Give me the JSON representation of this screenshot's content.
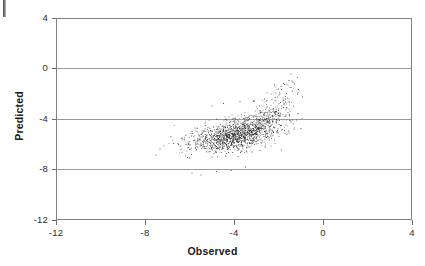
{
  "figure": {
    "name": "observed-vs-predicted-scatter",
    "artifact_label": "scan-edge-mark"
  },
  "axes": {
    "x_title": "Observed",
    "y_title": "Predicted",
    "x_ticks": [
      "-12",
      "-8",
      "-4",
      "0",
      "4"
    ],
    "y_ticks": [
      "4",
      "0",
      "-4",
      "-8",
      "-12"
    ]
  },
  "chart_data": {
    "type": "scatter",
    "title": "",
    "subtitle": "",
    "xlabel": "Observed",
    "ylabel": "Predicted",
    "xlim": [
      -12,
      4
    ],
    "ylim": [
      -12,
      4
    ],
    "xticks": [
      -12,
      -8,
      -4,
      0,
      4
    ],
    "yticks": [
      -12,
      -8,
      -4,
      0,
      4
    ],
    "grid": "horizontal",
    "legend": "none",
    "marker": {
      "shape": "dot",
      "size_px": 1,
      "color": "#2a2a2a",
      "opacity": 0.8
    },
    "n_points": 1650,
    "annotations": [],
    "series": [
      {
        "name": "observations",
        "description": "Dense elliptical cloud of observed vs predicted values with a positively-sloped upper-right tail.",
        "distribution": {
          "model": "bivariate-normal-mixture",
          "components": [
            {
              "weight": 0.7,
              "n": 1155,
              "mean_x": -4.15,
              "mean_y": -5.25,
              "sd_x": 0.95,
              "sd_y": 0.62,
              "corr": 0.42
            },
            {
              "weight": 0.22,
              "n": 363,
              "mean_x": -3.05,
              "mean_y": -4.35,
              "sd_x": 0.85,
              "sd_y": 0.75,
              "corr": 0.55
            },
            {
              "weight": 0.08,
              "n": 132,
              "mean_x": -2.25,
              "mean_y": -3.1,
              "sd_x": 0.55,
              "sd_y": 1.05,
              "corr": 0.7
            }
          ],
          "x_range_observed": [
            -6.2,
            -1.6
          ],
          "y_range_observed": [
            -8.3,
            -1.0
          ]
        },
        "outliers": [
          {
            "x": -1.85,
            "y": -1.05
          },
          {
            "x": -1.8,
            "y": -1.15
          },
          {
            "x": -1.95,
            "y": -1.3
          },
          {
            "x": -2.0,
            "y": -1.9
          },
          {
            "x": -1.75,
            "y": -2.1
          },
          {
            "x": -2.35,
            "y": -2.35
          },
          {
            "x": -1.6,
            "y": -2.55
          },
          {
            "x": -1.05,
            "y": -4.65
          },
          {
            "x": -5.95,
            "y": -8.15
          },
          {
            "x": -5.55,
            "y": -8.3
          },
          {
            "x": -4.85,
            "y": -8.05
          },
          {
            "x": -4.2,
            "y": -7.95
          },
          {
            "x": -3.55,
            "y": -7.7
          },
          {
            "x": -6.15,
            "y": -6.95
          },
          {
            "x": -5.05,
            "y": -2.85
          },
          {
            "x": -4.55,
            "y": -2.65
          },
          {
            "x": -3.8,
            "y": -2.5
          },
          {
            "x": -3.2,
            "y": -2.45
          },
          {
            "x": -2.7,
            "y": -2.3
          }
        ]
      }
    ]
  }
}
